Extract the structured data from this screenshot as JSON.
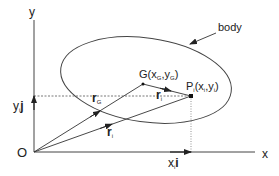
{
  "diagram": {
    "axes": {
      "x_label": "x",
      "y_label": "y",
      "origin_label": "O"
    },
    "body_label": "body",
    "points": {
      "G": {
        "name": "G",
        "open": "(x",
        "sub1": "G",
        "comma": ",y",
        "sub2": "G",
        "close": ")"
      },
      "P": {
        "name": "P",
        "sub": "i",
        "open": "(x",
        "sub1": "i",
        "comma": ",y",
        "sub2": "i",
        "close": ")"
      }
    },
    "vectors": {
      "rG": {
        "main": "r",
        "sub": "G"
      },
      "ri": {
        "main": "r",
        "sub": "i"
      },
      "ri_prime": {
        "main": "r",
        "sub": "i",
        "prime": "'"
      }
    },
    "components": {
      "xi": {
        "main": "x",
        "sub": "i",
        "unit": "i"
      },
      "yj": {
        "main": "y",
        "sub": "i",
        "unit": "j"
      }
    },
    "colors": {
      "stroke": "#333333",
      "text": "#222222"
    }
  }
}
